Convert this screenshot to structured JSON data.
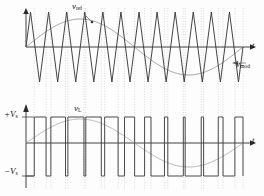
{
  "figure": {
    "background": "#fdfdfd",
    "width": 264,
    "height": 196
  },
  "colors": {
    "carrier": "#3a3a3a",
    "modulating": "#8e8e8e",
    "output": "#4a4a4a",
    "axis": "#2b2b2b",
    "grid": "#b9b9b9",
    "sine_reference": "#a8a8a8"
  },
  "labels": {
    "v_ref": "v",
    "v_ref_sub": "ref",
    "v_mod": "v",
    "v_mod_sub": "mod",
    "v_L": "v",
    "v_L_sub": "L",
    "t_axis_top": "t",
    "t_axis_bottom": "t",
    "plus_vs": "+V",
    "plus_vs_sub": "s",
    "minus_vs": "−V",
    "minus_vs_sub": "s"
  },
  "chart_data": {
    "type": "line",
    "panels": [
      {
        "name": "carrier-and-modulating",
        "xlabel": "t",
        "ylabel": "",
        "xlim": [
          0,
          1
        ],
        "ylim": [
          -1.15,
          1.15
        ],
        "grid": "vertical-dotted-at-intersections",
        "series": [
          {
            "name": "v_ref",
            "kind": "triangular-carrier",
            "cycles": 12,
            "amplitude": 1.0,
            "phase": 0,
            "color": "#3a3a3a",
            "legend_label": "v_ref"
          },
          {
            "name": "v_mod",
            "kind": "sinusoid",
            "cycles": 1,
            "amplitude": 0.8,
            "phase": 0,
            "color": "#8e8e8e",
            "legend_label": "v_mod"
          }
        ]
      },
      {
        "name": "output-voltage",
        "xlabel": "t",
        "ylabel": "v_L",
        "xlim": [
          0,
          1
        ],
        "ylim": [
          -1.3,
          1.3
        ],
        "ytick_labels": [
          "+V_s",
          "−V_s"
        ],
        "ytick_values": [
          1,
          -1
        ],
        "grid": "vertical-dotted-at-switching-instants",
        "series": [
          {
            "name": "v_L",
            "kind": "bipolar-pwm",
            "high_level": 1,
            "low_level": -1,
            "carrier_cycles": 12,
            "modulation_index": 0.8,
            "color": "#4a4a4a",
            "legend_label": "v_L"
          },
          {
            "name": "fundamental",
            "kind": "sinusoid",
            "cycles": 1,
            "amplitude": 0.8,
            "phase": 0,
            "color": "#a8a8a8",
            "legend_label": ""
          }
        ]
      }
    ]
  }
}
